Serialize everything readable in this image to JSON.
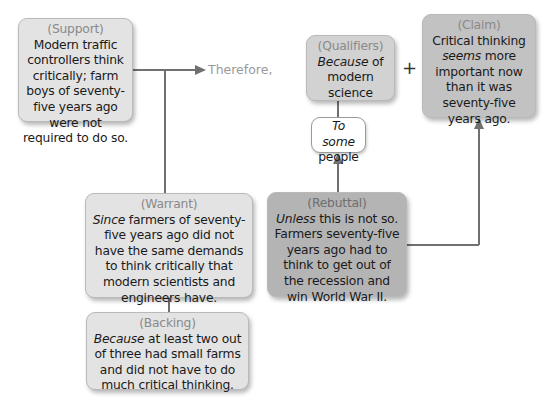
{
  "diagram": {
    "type": "Toulmin argument model",
    "connector_label": "Therefore,",
    "plus_sign": "+",
    "nodes": {
      "support": {
        "label": "(Support)",
        "text": "Modern traffic controllers think critically; farm boys of seventy-five years ago were not required to do so."
      },
      "qualifiers": {
        "label": "(Qualifiers)",
        "italic_lead": "Because",
        "text": " of modern science"
      },
      "claim": {
        "label": "(Claim)",
        "text_pre": "Critical thinking ",
        "italic_word": "seems",
        "text_post": " more important now than it was seventy-five years ago."
      },
      "to_some_people": {
        "italic_lead": "To some",
        "text": " people"
      },
      "warrant": {
        "label": "(Warrant)",
        "italic_lead": "Since",
        "text": " farmers of seventy-five years ago did not have the same demands to think critically that modern scientists and engineers have."
      },
      "rebuttal": {
        "label": "(Rebuttal)",
        "italic_lead": "Unless",
        "text": " this is not so. Farmers seventy-five years ago had to think to get out of the recession and win World War II."
      },
      "backing": {
        "label": "(Backing)",
        "italic_lead": "Because",
        "text": " at least two out of three had small farms and did not have to do much critical thinking."
      }
    },
    "colors": {
      "support_fill": "#e3e3e3",
      "qualifiers_fill": "#d2d2d2",
      "claim_fill": "#c2c2c2",
      "warrant_fill": "#e3e3e3",
      "backing_fill": "#e3e3e3",
      "rebuttal_fill": "#b4b4b4",
      "connector": "#707070",
      "label_gray": "#8a8a8a"
    }
  }
}
